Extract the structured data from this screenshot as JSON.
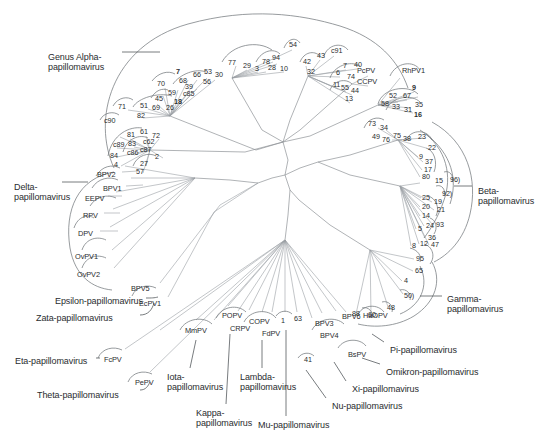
{
  "figure": {
    "type": "unrooted-phylogenetic-tree",
    "line_color": "#8e9296",
    "text_color": "#2a2d2f",
    "background": "#ffffff"
  },
  "genus_labels": [
    {
      "id": "alpha",
      "text_line1": "Genus Alpha-",
      "text_line2": "papillomavirus",
      "x": 48,
      "y": 52,
      "two_line": true
    },
    {
      "id": "delta",
      "text_line1": "Delta-",
      "text_line2": "papillomavirus",
      "x": 14,
      "y": 182,
      "two_line": true
    },
    {
      "id": "beta",
      "text_line1": "Beta-",
      "text_line2": "papillomavirus",
      "x": 478,
      "y": 186,
      "two_line": true
    },
    {
      "id": "gamma",
      "text_line1": "Gamma-",
      "text_line2": "papillomavirus",
      "x": 447,
      "y": 294,
      "two_line": true
    },
    {
      "id": "epsilon",
      "text_line1": "Epsilon-papillomavirus",
      "text_line2": "",
      "x": 55,
      "y": 296,
      "two_line": false
    },
    {
      "id": "zata",
      "text_line1": "Zata-papillomavirus",
      "text_line2": "",
      "x": 36,
      "y": 313,
      "two_line": false
    },
    {
      "id": "eta",
      "text_line1": "Eta-papillomavirus",
      "text_line2": "",
      "x": 15,
      "y": 356,
      "two_line": false
    },
    {
      "id": "theta",
      "text_line1": "Theta-papillomavirus",
      "text_line2": "",
      "x": 37,
      "y": 390,
      "two_line": false
    },
    {
      "id": "iota",
      "text_line1": "Iota-",
      "text_line2": "papillomavirus",
      "x": 167,
      "y": 372,
      "two_line": true
    },
    {
      "id": "kappa",
      "text_line1": "Kappa-",
      "text_line2": "papillomavirus",
      "x": 196,
      "y": 408,
      "two_line": true
    },
    {
      "id": "lambda",
      "text_line1": "Lambda-",
      "text_line2": "papillomavirus",
      "x": 240,
      "y": 372,
      "two_line": true
    },
    {
      "id": "mu",
      "text_line1": "Mu-papillomavirus",
      "text_line2": "",
      "x": 258,
      "y": 420,
      "two_line": false
    },
    {
      "id": "nu",
      "text_line1": "Nu-papillomavirus",
      "text_line2": "",
      "x": 332,
      "y": 401,
      "two_line": false
    },
    {
      "id": "xi",
      "text_line1": "Xi-papillomavirus",
      "text_line2": "",
      "x": 352,
      "y": 384,
      "two_line": false
    },
    {
      "id": "omikron",
      "text_line1": "Omikron-papillomavirus",
      "text_line2": "",
      "x": 386,
      "y": 367,
      "two_line": false
    },
    {
      "id": "pi",
      "text_line1": "Pi-papillomavirus",
      "text_line2": "",
      "x": 390,
      "y": 345,
      "two_line": false
    }
  ],
  "taxon_labels": [
    {
      "text": "BPV2",
      "x": 97,
      "y": 171
    },
    {
      "text": "BPV1",
      "x": 103,
      "y": 185
    },
    {
      "text": "EEPV",
      "x": 85,
      "y": 195
    },
    {
      "text": "RPV",
      "x": 83,
      "y": 212
    },
    {
      "text": "DPV",
      "x": 78,
      "y": 230
    },
    {
      "text": "OvPV1",
      "x": 75,
      "y": 253
    },
    {
      "text": "OvPV2",
      "x": 77,
      "y": 271
    },
    {
      "text": "BPV5",
      "x": 131,
      "y": 285
    },
    {
      "text": "EcPV1",
      "x": 139,
      "y": 300
    },
    {
      "text": "FcPV",
      "x": 104,
      "y": 356
    },
    {
      "text": "PePV",
      "x": 135,
      "y": 379
    },
    {
      "text": "MmPV",
      "x": 185,
      "y": 327
    },
    {
      "text": "POPV",
      "x": 222,
      "y": 312
    },
    {
      "text": "CRPV",
      "x": 230,
      "y": 325
    },
    {
      "text": "COPV",
      "x": 249,
      "y": 318
    },
    {
      "text": "FdPV",
      "x": 262,
      "y": 330
    },
    {
      "text": "BPV3",
      "x": 315,
      "y": 320
    },
    {
      "text": "BPV4",
      "x": 320,
      "y": 332
    },
    {
      "text": "BPV6",
      "x": 342,
      "y": 313
    },
    {
      "text": "HaOPV",
      "x": 363,
      "y": 312
    },
    {
      "text": "BsPV",
      "x": 348,
      "y": 351
    },
    {
      "text": "PcPV",
      "x": 357,
      "y": 67
    },
    {
      "text": "CCPV",
      "x": 357,
      "y": 78
    },
    {
      "text": "RhPV1",
      "x": 402,
      "y": 67
    }
  ],
  "type_numbers": [
    {
      "text": "7",
      "x": 176,
      "y": 68,
      "bold": true
    },
    {
      "text": "70",
      "x": 157,
      "y": 80,
      "bold": false
    },
    {
      "text": "68",
      "x": 179,
      "y": 77,
      "bold": false
    },
    {
      "text": "66",
      "x": 193,
      "y": 71,
      "bold": false
    },
    {
      "text": "53",
      "x": 204,
      "y": 68,
      "bold": false
    },
    {
      "text": "30",
      "x": 215,
      "y": 71,
      "bold": false
    },
    {
      "text": "39",
      "x": 185,
      "y": 83,
      "bold": false
    },
    {
      "text": "56",
      "x": 203,
      "y": 78,
      "bold": false
    },
    {
      "text": "59",
      "x": 168,
      "y": 89,
      "bold": false
    },
    {
      "text": "c85",
      "x": 183,
      "y": 90,
      "bold": false
    },
    {
      "text": "45",
      "x": 155,
      "y": 95,
      "bold": false
    },
    {
      "text": "18",
      "x": 174,
      "y": 98,
      "bold": true
    },
    {
      "text": "51",
      "x": 140,
      "y": 102,
      "bold": false
    },
    {
      "text": "69",
      "x": 152,
      "y": 104,
      "bold": false
    },
    {
      "text": "26",
      "x": 166,
      "y": 104,
      "bold": false
    },
    {
      "text": "71",
      "x": 118,
      "y": 103,
      "bold": false
    },
    {
      "text": "82",
      "x": 137,
      "y": 112,
      "bold": false
    },
    {
      "text": "c90",
      "x": 104,
      "y": 117,
      "bold": false
    },
    {
      "text": "81",
      "x": 127,
      "y": 131,
      "bold": false
    },
    {
      "text": "61",
      "x": 140,
      "y": 128,
      "bold": false
    },
    {
      "text": "72",
      "x": 152,
      "y": 132,
      "bold": false
    },
    {
      "text": "83",
      "x": 128,
      "y": 140,
      "bold": false
    },
    {
      "text": "c62",
      "x": 143,
      "y": 138,
      "bold": false
    },
    {
      "text": "c89",
      "x": 113,
      "y": 141,
      "bold": false
    },
    {
      "text": "c87",
      "x": 140,
      "y": 146,
      "bold": false
    },
    {
      "text": "c86",
      "x": 127,
      "y": 149,
      "bold": false
    },
    {
      "text": "84",
      "x": 110,
      "y": 152,
      "bold": false
    },
    {
      "text": "2",
      "x": 155,
      "y": 153,
      "bold": false
    },
    {
      "text": "4",
      "x": 114,
      "y": 161,
      "bold": false
    },
    {
      "text": "27",
      "x": 140,
      "y": 160,
      "bold": false
    },
    {
      "text": "57",
      "x": 136,
      "y": 168,
      "bold": false
    },
    {
      "text": "77",
      "x": 228,
      "y": 59,
      "bold": false
    },
    {
      "text": "29",
      "x": 243,
      "y": 62,
      "bold": false
    },
    {
      "text": "3",
      "x": 255,
      "y": 65,
      "bold": false
    },
    {
      "text": "78",
      "x": 262,
      "y": 58,
      "bold": false
    },
    {
      "text": "94",
      "x": 272,
      "y": 54,
      "bold": false
    },
    {
      "text": "28",
      "x": 268,
      "y": 64,
      "bold": false
    },
    {
      "text": "10",
      "x": 280,
      "y": 65,
      "bold": false
    },
    {
      "text": "54",
      "x": 289,
      "y": 41,
      "bold": false
    },
    {
      "text": "42",
      "x": 303,
      "y": 58,
      "bold": false
    },
    {
      "text": "32",
      "x": 307,
      "y": 68,
      "bold": false
    },
    {
      "text": "43",
      "x": 317,
      "y": 52,
      "bold": false
    },
    {
      "text": "c91",
      "x": 331,
      "y": 47,
      "bold": false
    },
    {
      "text": "7",
      "x": 343,
      "y": 62,
      "bold": false
    },
    {
      "text": "40",
      "x": 354,
      "y": 61,
      "bold": false
    },
    {
      "text": "6",
      "x": 336,
      "y": 69,
      "bold": false
    },
    {
      "text": "11",
      "x": 333,
      "y": 81,
      "bold": false
    },
    {
      "text": "55",
      "x": 341,
      "y": 84,
      "bold": false
    },
    {
      "text": "74",
      "x": 347,
      "y": 73,
      "bold": false
    },
    {
      "text": "44",
      "x": 351,
      "y": 87,
      "bold": false
    },
    {
      "text": "13",
      "x": 345,
      "y": 95,
      "bold": false
    },
    {
      "text": "9",
      "x": 412,
      "y": 84,
      "bold": true
    },
    {
      "text": "52",
      "x": 389,
      "y": 92,
      "bold": false
    },
    {
      "text": "67",
      "x": 403,
      "y": 92,
      "bold": false
    },
    {
      "text": "58",
      "x": 381,
      "y": 100,
      "bold": false
    },
    {
      "text": "33",
      "x": 392,
      "y": 103,
      "bold": false
    },
    {
      "text": "31",
      "x": 404,
      "y": 106,
      "bold": false
    },
    {
      "text": "35",
      "x": 415,
      "y": 101,
      "bold": false
    },
    {
      "text": "16",
      "x": 414,
      "y": 111,
      "bold": true
    },
    {
      "text": "73",
      "x": 368,
      "y": 120,
      "bold": false
    },
    {
      "text": "34",
      "x": 380,
      "y": 124,
      "bold": false
    },
    {
      "text": "49",
      "x": 372,
      "y": 133,
      "bold": false
    },
    {
      "text": "76",
      "x": 382,
      "y": 136,
      "bold": false
    },
    {
      "text": "75",
      "x": 393,
      "y": 132,
      "bold": false
    },
    {
      "text": "38",
      "x": 403,
      "y": 135,
      "bold": false
    },
    {
      "text": "23",
      "x": 418,
      "y": 133,
      "bold": false
    },
    {
      "text": "22",
      "x": 428,
      "y": 144,
      "bold": false
    },
    {
      "text": "9",
      "x": 419,
      "y": 153,
      "bold": false
    },
    {
      "text": "37",
      "x": 425,
      "y": 158,
      "bold": false
    },
    {
      "text": "17",
      "x": 424,
      "y": 166,
      "bold": false
    },
    {
      "text": "80",
      "x": 422,
      "y": 173,
      "bold": false
    },
    {
      "text": "15",
      "x": 435,
      "y": 177,
      "bold": false
    },
    {
      "text": "96)",
      "x": 450,
      "y": 176,
      "bold": false
    },
    {
      "text": "92)",
      "x": 442,
      "y": 190,
      "bold": false
    },
    {
      "text": "25",
      "x": 422,
      "y": 194,
      "bold": false
    },
    {
      "text": "19",
      "x": 434,
      "y": 198,
      "bold": false
    },
    {
      "text": "20",
      "x": 422,
      "y": 203,
      "bold": false
    },
    {
      "text": "21",
      "x": 437,
      "y": 206,
      "bold": false
    },
    {
      "text": "14",
      "x": 422,
      "y": 212,
      "bold": false
    },
    {
      "text": "93",
      "x": 436,
      "y": 221,
      "bold": false
    },
    {
      "text": "5",
      "x": 418,
      "y": 225,
      "bold": false
    },
    {
      "text": "24",
      "x": 426,
      "y": 222,
      "bold": false
    },
    {
      "text": "36",
      "x": 428,
      "y": 234,
      "bold": false
    },
    {
      "text": "8",
      "x": 412,
      "y": 242,
      "bold": false
    },
    {
      "text": "12",
      "x": 420,
      "y": 240,
      "bold": false
    },
    {
      "text": "47",
      "x": 431,
      "y": 241,
      "bold": false
    },
    {
      "text": "95",
      "x": 416,
      "y": 255,
      "bold": false
    },
    {
      "text": "65",
      "x": 415,
      "y": 267,
      "bold": false
    },
    {
      "text": "4",
      "x": 404,
      "y": 277,
      "bold": false
    },
    {
      "text": "50)",
      "x": 404,
      "y": 292,
      "bold": false
    },
    {
      "text": "48",
      "x": 387,
      "y": 304,
      "bold": false
    },
    {
      "text": "60,",
      "x": 368,
      "y": 311,
      "bold": false
    },
    {
      "text": "88",
      "x": 352,
      "y": 310,
      "bold": false
    },
    {
      "text": "1",
      "x": 281,
      "y": 317,
      "bold": false
    },
    {
      "text": "63",
      "x": 294,
      "y": 315,
      "bold": false
    },
    {
      "text": "41",
      "x": 304,
      "y": 356,
      "bold": false
    }
  ]
}
